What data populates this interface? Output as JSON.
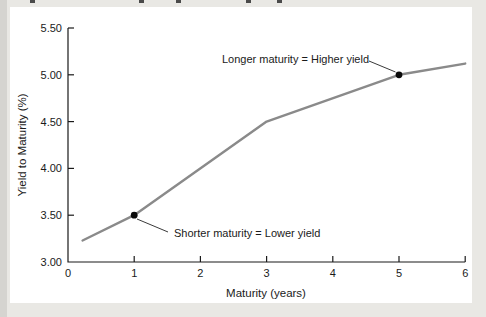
{
  "window": {
    "background": "#e9e8e4",
    "panel_background": "#ffffff",
    "left_edge_color": "#d5d4d0"
  },
  "artifacts": {
    "top_cropped_text_marks_x": [
      30,
      139,
      176,
      246,
      277
    ]
  },
  "colors": {
    "axis": "#1a1a1a",
    "curve": "#8a8a8a",
    "marker": "#0a0a0a",
    "leader_line": "#3a3a3a",
    "text": "#1a1a1a"
  },
  "chart_data": {
    "type": "line",
    "title": "",
    "xlabel": "Maturity (years)",
    "ylabel": "Yield to Maturity (%)",
    "xlim": [
      0,
      6
    ],
    "ylim": [
      3.0,
      5.5
    ],
    "grid": false,
    "x_ticks": [
      0,
      1,
      2,
      3,
      4,
      5,
      6
    ],
    "x_tick_labels": [
      "0",
      "1",
      "2",
      "3",
      "4",
      "5",
      "6"
    ],
    "y_ticks": [
      3.0,
      3.5,
      4.0,
      4.5,
      5.0,
      5.5
    ],
    "y_tick_labels": [
      "3.00",
      "3.50",
      "4.00",
      "4.50",
      "5.00",
      "5.50"
    ],
    "series": [
      {
        "name": "yield curve",
        "color": "#8a8a8a",
        "points": [
          [
            0.22,
            3.23
          ],
          [
            1,
            3.5
          ],
          [
            3,
            4.5
          ],
          [
            5,
            5.0
          ],
          [
            6,
            5.12
          ]
        ]
      }
    ],
    "markers": [
      {
        "x": 1,
        "y": 3.5
      },
      {
        "x": 5,
        "y": 5.0
      }
    ],
    "annotations": [
      {
        "text": "Longer maturity = Higher yield",
        "target_x": 5,
        "target_y": 5.0
      },
      {
        "text": "Shorter maturity = Lower yield",
        "target_x": 1,
        "target_y": 3.5
      }
    ]
  }
}
